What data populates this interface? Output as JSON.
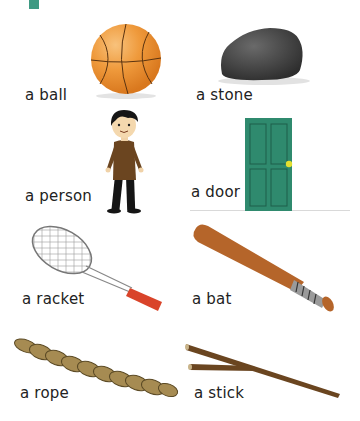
{
  "page": {
    "accent_color": "#3f9a83"
  },
  "items": [
    {
      "label": "a ball",
      "icon": "basketball-icon"
    },
    {
      "label": "a stone",
      "icon": "stone-icon"
    },
    {
      "label": "a person",
      "icon": "person-icon"
    },
    {
      "label": "a door",
      "icon": "door-icon"
    },
    {
      "label": "a racket",
      "icon": "tennis-racket-icon"
    },
    {
      "label": "a bat",
      "icon": "baseball-bat-icon"
    },
    {
      "label": "a rope",
      "icon": "rope-icon"
    },
    {
      "label": "a stick",
      "icon": "stick-icon"
    }
  ]
}
